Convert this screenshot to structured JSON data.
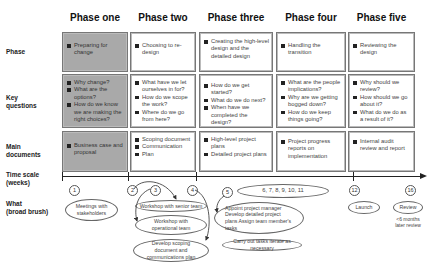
{
  "phases": [
    {
      "title": "Phase one",
      "shaded": true,
      "phase": [
        "Preparing for change"
      ],
      "key_questions": [
        "Why change?",
        "What are the options?",
        "How do we know we are making the right choices?"
      ],
      "main_documents": [
        "Business case and proposal"
      ]
    },
    {
      "title": "Phase two",
      "shaded": false,
      "phase": [
        "Choosing to re-design"
      ],
      "key_questions": [
        "What have we let ourselves in for?",
        "How do we scope the work?",
        "Where do we go from here?"
      ],
      "main_documents": [
        "Scoping document",
        "Communication",
        "Plan"
      ]
    },
    {
      "title": "Phase three",
      "shaded": false,
      "phase": [
        "Creating the high-level design and the detailed design"
      ],
      "key_questions": [
        "How do we get started?",
        "What do we do next?",
        "When have we completed the design?"
      ],
      "main_documents": [
        "High-level project plans",
        "Detailed project plans"
      ]
    },
    {
      "title": "Phase four",
      "shaded": false,
      "phase": [
        "Handling the transition"
      ],
      "key_questions": [
        "What are the people implications?",
        "Why are we getting bogged down?",
        "How do we keep things going?"
      ],
      "main_documents": [
        "Project progress reports on implementation"
      ]
    },
    {
      "title": "Phase five",
      "shaded": false,
      "phase": [
        "Reviewing the design"
      ],
      "key_questions": [
        "Why should we review?",
        "How should we go about it?",
        "What do we do as a result of it?"
      ],
      "main_documents": [
        "Internal audit review and report"
      ]
    }
  ],
  "row_labels": {
    "phase": "Phase",
    "key_questions_1": "Key",
    "key_questions_2": "questions",
    "main_documents_1": "Main",
    "main_documents_2": "documents",
    "time_scale_1": "Time scale",
    "time_scale_2": "(weeks)",
    "what_1": "What",
    "what_2": "(broad brush)"
  },
  "weeks": {
    "w1": "1",
    "w2": "2",
    "w3": "3",
    "w4": "4",
    "w5": "5",
    "w6_11": "6,  7,  8,  9,  10,  11",
    "w12": "12",
    "w16": "16"
  },
  "activities": {
    "meetings": "Meetings with stakeholders",
    "workshop_senior": "Workshop with senior team",
    "workshop_operational": "Workshop with operational team",
    "scoping_doc": "Develop scoping document and communications plan",
    "appoint": "Appoint project manager Develop detailed project plans Assign team member's tasks",
    "carry_out": "Carry out tasks iterate as necessary",
    "launch": "Launch",
    "review": "Review",
    "review_note": "<6 months later review"
  },
  "colors": {
    "shaded_fill": "#a9a9a9",
    "border": "#777777",
    "text": "#444444"
  }
}
